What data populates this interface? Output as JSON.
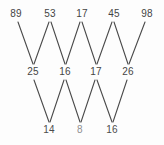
{
  "diagram": {
    "type": "zigzag-minimum-tournament",
    "background_color": "#fdfdfd",
    "line_color": "#4a4a4a",
    "text_color": "#4a4a4a",
    "rows": [
      {
        "name": "top-row",
        "nodes": [
          {
            "value": "89",
            "x": 16,
            "y": 14
          },
          {
            "value": "53",
            "x": 50,
            "y": 14
          },
          {
            "value": "17",
            "x": 82,
            "y": 14
          },
          {
            "value": "45",
            "x": 114,
            "y": 14
          },
          {
            "value": "98",
            "x": 147,
            "y": 14
          }
        ]
      },
      {
        "name": "middle-row",
        "nodes": [
          {
            "value": "25",
            "x": 33,
            "y": 72
          },
          {
            "value": "16",
            "x": 65,
            "y": 72
          },
          {
            "value": "17",
            "x": 96,
            "y": 72
          },
          {
            "value": "26",
            "x": 128,
            "y": 72
          }
        ]
      },
      {
        "name": "bottom-row",
        "nodes": [
          {
            "value": "14",
            "x": 49,
            "y": 130
          },
          {
            "value": "8",
            "x": 80,
            "y": 130
          },
          {
            "value": "16",
            "x": 112,
            "y": 130
          }
        ]
      }
    ],
    "edges_upper": [
      {
        "from": "89",
        "to": "25",
        "x1": 18,
        "y1": 22,
        "x2": 33,
        "y2": 64
      },
      {
        "from": "53",
        "to": "25",
        "x1": 49,
        "y1": 22,
        "x2": 34,
        "y2": 64
      },
      {
        "from": "53",
        "to": "16",
        "x1": 51,
        "y1": 22,
        "x2": 65,
        "y2": 64
      },
      {
        "from": "17",
        "to": "16",
        "x1": 80,
        "y1": 22,
        "x2": 66,
        "y2": 64
      },
      {
        "from": "17",
        "to": "17b",
        "x1": 82,
        "y1": 22,
        "x2": 96,
        "y2": 64
      },
      {
        "from": "45",
        "to": "17b",
        "x1": 112,
        "y1": 22,
        "x2": 97,
        "y2": 64
      },
      {
        "from": "45",
        "to": "26",
        "x1": 114,
        "y1": 22,
        "x2": 128,
        "y2": 64
      },
      {
        "from": "98",
        "to": "26",
        "x1": 145,
        "y1": 22,
        "x2": 129,
        "y2": 64
      }
    ],
    "edges_lower": [
      {
        "from": "25",
        "to": "14",
        "x1": 34,
        "y1": 80,
        "x2": 49,
        "y2": 122
      },
      {
        "from": "16",
        "to": "14",
        "x1": 64,
        "y1": 80,
        "x2": 50,
        "y2": 122
      },
      {
        "from": "16",
        "to": "8",
        "x1": 66,
        "y1": 80,
        "x2": 80,
        "y2": 122
      },
      {
        "from": "17b",
        "to": "8",
        "x1": 95,
        "y1": 80,
        "x2": 81,
        "y2": 122
      },
      {
        "from": "17b",
        "to": "16b",
        "x1": 97,
        "y1": 80,
        "x2": 112,
        "y2": 122
      },
      {
        "from": "26",
        "to": "16b",
        "x1": 127,
        "y1": 80,
        "x2": 113,
        "y2": 122
      }
    ]
  }
}
